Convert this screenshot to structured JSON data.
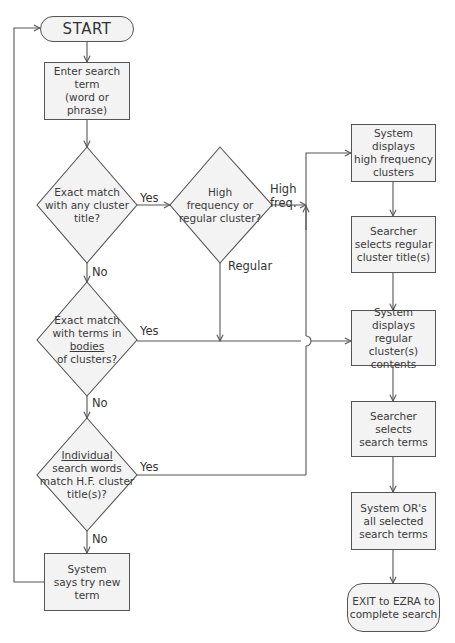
{
  "diagram": {
    "type": "flowchart",
    "colors": {
      "node_fill": "#f3f3f3",
      "stroke": "#555555",
      "text": "#3a3a3a",
      "background": "#ffffff"
    },
    "nodes": {
      "start": {
        "shape": "terminator",
        "text": "START"
      },
      "enter_term": {
        "shape": "process",
        "lines": [
          "Enter search term",
          "(word or phrase)"
        ]
      },
      "decision_title": {
        "shape": "decision",
        "lines": [
          "Exact match",
          "with any cluster",
          "title?"
        ]
      },
      "decision_freq": {
        "shape": "decision",
        "lines": [
          "High",
          "frequency or",
          "regular cluster?"
        ]
      },
      "decision_bodies": {
        "shape": "decision",
        "lines": [
          "Exact match",
          "with terms in",
          "bodies",
          "of clusters?"
        ]
      },
      "decision_individual": {
        "shape": "decision",
        "lines": [
          "Individual",
          "search words",
          "match H.F. cluster",
          "title(s)?"
        ]
      },
      "try_new": {
        "shape": "process",
        "lines": [
          "System",
          "says try new term"
        ]
      },
      "display_hf": {
        "shape": "process",
        "lines": [
          "System displays",
          "high frequency",
          "clusters"
        ]
      },
      "select_regular": {
        "shape": "process",
        "lines": [
          "Searcher",
          "selects regular",
          "cluster title(s)"
        ]
      },
      "display_regular": {
        "shape": "process",
        "lines": [
          "System displays",
          "regular cluster(s)",
          "contents"
        ]
      },
      "select_terms": {
        "shape": "process",
        "lines": [
          "Searcher selects",
          "search terms"
        ]
      },
      "or_terms": {
        "shape": "process",
        "lines": [
          "System OR's",
          "all selected",
          "search terms"
        ]
      },
      "exit": {
        "shape": "terminator",
        "lines": [
          "EXIT to EZRA to",
          "complete search"
        ]
      }
    },
    "edge_labels": {
      "title_yes": "Yes",
      "title_no": "No",
      "freq_high_1": "High",
      "freq_high_2": "freq.",
      "freq_regular": "Regular",
      "bodies_yes": "Yes",
      "bodies_no": "No",
      "individual_yes": "Yes",
      "individual_no": "No"
    },
    "edges": [
      [
        "start",
        "enter_term"
      ],
      [
        "enter_term",
        "decision_title"
      ],
      [
        "decision_title",
        "decision_freq",
        "Yes"
      ],
      [
        "decision_title",
        "decision_bodies",
        "No"
      ],
      [
        "decision_freq",
        "display_hf",
        "High freq."
      ],
      [
        "decision_freq",
        "display_regular",
        "Regular"
      ],
      [
        "decision_bodies",
        "display_regular",
        "Yes"
      ],
      [
        "decision_bodies",
        "decision_individual",
        "No"
      ],
      [
        "decision_individual",
        "display_hf",
        "Yes"
      ],
      [
        "decision_individual",
        "try_new",
        "No"
      ],
      [
        "try_new",
        "start"
      ],
      [
        "display_hf",
        "select_regular"
      ],
      [
        "select_regular",
        "display_regular"
      ],
      [
        "display_regular",
        "select_terms"
      ],
      [
        "select_terms",
        "or_terms"
      ],
      [
        "or_terms",
        "exit"
      ]
    ]
  }
}
